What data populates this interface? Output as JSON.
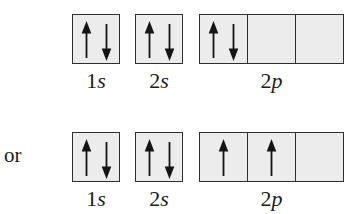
{
  "figure": {
    "description_or_label": "or",
    "rows": [
      {
        "name": "top-configuration",
        "orbitals": [
          {
            "id": "1s",
            "label_number": "1",
            "label_letter": "s",
            "cells": [
              [
                "up",
                "down"
              ]
            ]
          },
          {
            "id": "2s",
            "label_number": "2",
            "label_letter": "s",
            "cells": [
              [
                "up",
                "down"
              ]
            ]
          },
          {
            "id": "2p",
            "label_number": "2",
            "label_letter": "p",
            "cells": [
              [
                "up",
                "down"
              ],
              [],
              []
            ]
          }
        ]
      },
      {
        "name": "bottom-configuration",
        "orbitals": [
          {
            "id": "1s",
            "label_number": "1",
            "label_letter": "s",
            "cells": [
              [
                "up",
                "down"
              ]
            ]
          },
          {
            "id": "2s",
            "label_number": "2",
            "label_letter": "s",
            "cells": [
              [
                "up",
                "down"
              ]
            ]
          },
          {
            "id": "2p",
            "label_number": "2",
            "label_letter": "p",
            "cells": [
              [
                "up"
              ],
              [
                "up"
              ],
              []
            ]
          }
        ]
      }
    ],
    "icons": {
      "up": "up-arrow-icon",
      "down": "down-arrow-icon"
    },
    "colors": {
      "box_fill": "#ececec",
      "box_border": "#2e2e2e",
      "arrow": "#141414",
      "background": "#ffffff"
    }
  }
}
